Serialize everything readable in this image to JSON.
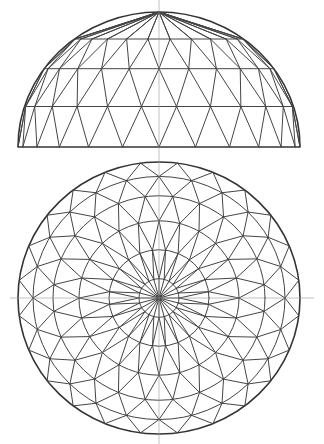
{
  "figure": {
    "stroke_color": "#444444",
    "background": "#ffffff"
  },
  "elevation": {
    "center_x": 159,
    "base_y": 147,
    "radius_x": 141,
    "height": 135,
    "ring_heights": [
      0,
      0.3,
      0.58,
      0.8,
      1.0
    ],
    "segments": 24,
    "twist_per_ring": 0.5
  },
  "plan": {
    "center_x": 159,
    "center_y": 298,
    "radius_x": 141,
    "radius_y": 136,
    "ring_radii": [
      20,
      50,
      80,
      106,
      126,
      141
    ],
    "segments": 24,
    "twist_per_ring": 0.5
  },
  "axis": {
    "vertical_x": 159,
    "horizontal_y": 298
  }
}
